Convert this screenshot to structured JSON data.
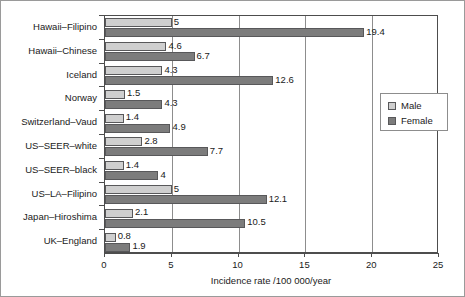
{
  "chart_data": {
    "type": "bar",
    "orientation": "horizontal",
    "title": "",
    "xlabel": "Incidence rate /100 000/year",
    "ylabel": "",
    "xlim": [
      0,
      25
    ],
    "xticks": [
      0,
      5,
      10,
      15,
      20,
      25
    ],
    "xtick_labels": [
      "0",
      "5",
      "10",
      "15",
      "20",
      "25"
    ],
    "grid": "vertical",
    "legend_position": "right",
    "categories": [
      "Hawaii–Filipino",
      "Hawaii–Chinese",
      "Iceland",
      "Norway",
      "Switzerland–Vaud",
      "US–SEER–white",
      "US–SEER–black",
      "US–LA–Filipino",
      "Japan–Hiroshima",
      "UK–England"
    ],
    "series": [
      {
        "name": "Male",
        "color": "#cfcfcf",
        "values": [
          5,
          4.6,
          4.3,
          1.5,
          1.4,
          2.8,
          1.4,
          5,
          2.1,
          0.8
        ],
        "labels": [
          "5",
          "4.6",
          "4.3",
          "1.5",
          "1.4",
          "2.8",
          "1.4",
          "5",
          "2.1",
          "0.8"
        ]
      },
      {
        "name": "Female",
        "color": "#7c7c7c",
        "values": [
          19.4,
          6.7,
          12.6,
          4.3,
          4.9,
          7.7,
          4,
          12.1,
          10.5,
          1.9
        ],
        "labels": [
          "19.4",
          "6.7",
          "12.6",
          "4.3",
          "4.9",
          "7.7",
          "4",
          "12.1",
          "10.5",
          "1.9"
        ]
      }
    ]
  },
  "legend": {
    "items": [
      {
        "label": "Male",
        "swatch": "male"
      },
      {
        "label": "Female",
        "swatch": "female"
      }
    ]
  }
}
